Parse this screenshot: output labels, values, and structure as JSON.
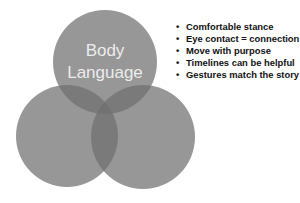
{
  "diagram": {
    "type": "venn",
    "circles": [
      {
        "id": "top",
        "cx": 105,
        "cy": 62,
        "r": 52,
        "label_lines": [
          "Body",
          "Language"
        ]
      },
      {
        "id": "bottom-left",
        "cx": 67,
        "cy": 136,
        "r": 51,
        "label_lines": []
      },
      {
        "id": "bottom-right",
        "cx": 143,
        "cy": 137,
        "r": 52,
        "label_lines": []
      }
    ],
    "circle_color": "#7f7f7f",
    "circle_opacity": 0.85,
    "label_color": "#e8e8e8"
  },
  "bullets": {
    "marker": "•",
    "items": [
      "Comfortable stance",
      "Eye contact = connection",
      "Move with purpose",
      "Timelines can be helpful",
      "Gestures match the story"
    ]
  }
}
